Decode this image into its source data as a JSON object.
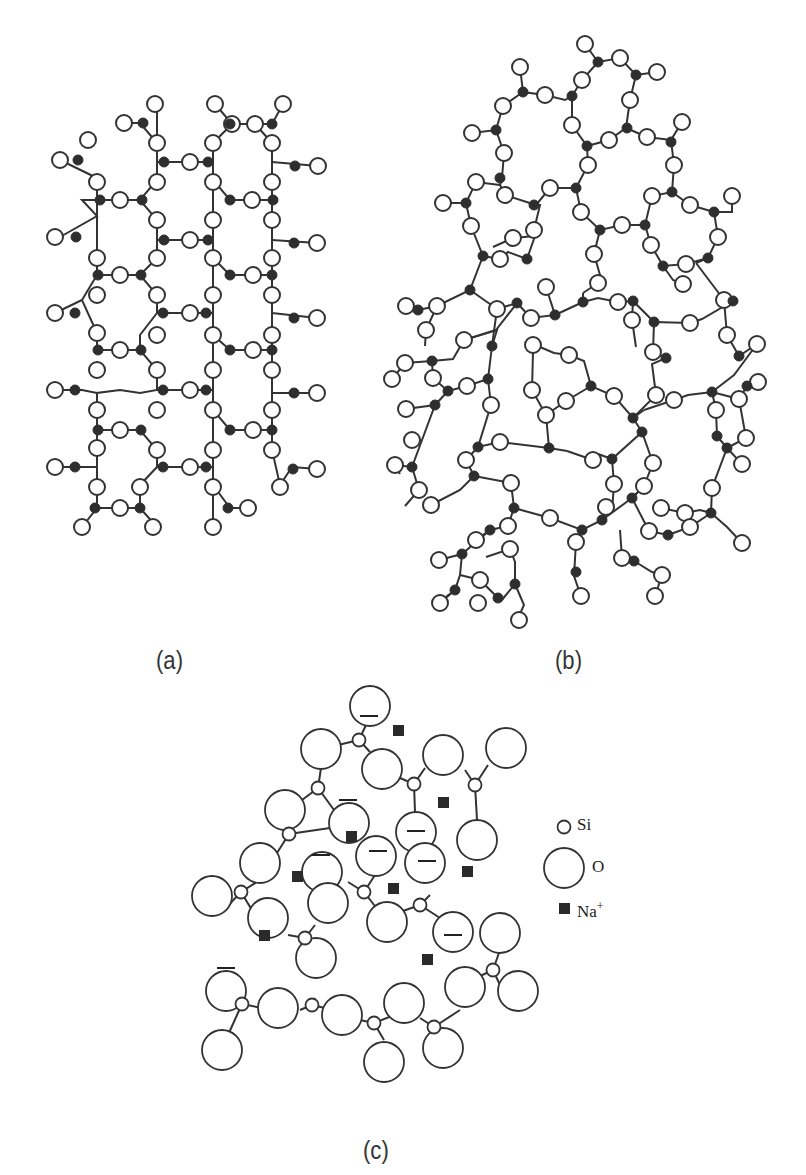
{
  "figure": {
    "panels": [
      {
        "id": "a",
        "label": "(a)",
        "description": "crystalline silica network"
      },
      {
        "id": "b",
        "label": "(b)",
        "description": "amorphous silica glass network"
      },
      {
        "id": "c",
        "label": "(c)",
        "description": "soda-silica glass network with Na+ ions"
      }
    ],
    "legend": {
      "si": "Si",
      "o": "O",
      "na": "Na",
      "na_charge": "+"
    },
    "colors": {
      "line": "#333333",
      "si_fill": "#2e2e2e",
      "o_fill": "#ffffff",
      "na_fill": "#2a2a2a"
    }
  },
  "panel_a": {
    "si": [
      [
        157,
        193
      ],
      [
        97,
        216
      ],
      [
        140,
        200
      ],
      [
        212,
        200
      ],
      [
        272,
        200
      ],
      [
        293,
        223
      ],
      [
        97,
        238
      ],
      [
        140,
        240
      ],
      [
        212,
        240
      ],
      [
        272,
        240
      ],
      [
        293,
        261
      ],
      [
        97,
        275
      ],
      [
        140,
        275
      ],
      [
        212,
        275
      ],
      [
        272,
        275
      ],
      [
        75,
        300
      ],
      [
        158,
        300
      ],
      [
        230,
        300
      ],
      [
        292,
        300
      ],
      [
        97,
        313
      ],
      [
        140,
        313
      ],
      [
        212,
        313
      ],
      [
        272,
        313
      ],
      [
        293,
        337
      ],
      [
        97,
        350
      ],
      [
        140,
        350
      ],
      [
        212,
        350
      ],
      [
        272,
        350
      ],
      [
        75,
        390
      ],
      [
        158,
        390
      ],
      [
        230,
        390
      ],
      [
        292,
        390
      ],
      [
        97,
        393
      ],
      [
        140,
        393
      ],
      [
        212,
        393
      ],
      [
        272,
        393
      ],
      [
        293,
        415
      ],
      [
        97,
        430
      ],
      [
        140,
        430
      ],
      [
        212,
        430
      ],
      [
        272,
        430
      ],
      [
        75,
        467
      ],
      [
        158,
        467
      ],
      [
        230,
        467
      ],
      [
        292,
        467
      ],
      [
        97,
        508
      ],
      [
        140,
        508
      ],
      [
        212,
        508
      ],
      [
        230,
        508
      ]
    ],
    "o": [
      [
        155,
        104
      ],
      [
        124,
        123
      ],
      [
        215,
        104
      ],
      [
        283,
        104
      ],
      [
        232,
        124
      ],
      [
        255,
        124
      ],
      [
        157,
        143
      ],
      [
        213,
        143
      ],
      [
        272,
        143
      ],
      [
        93,
        140
      ],
      [
        60,
        160
      ],
      [
        157,
        162
      ],
      [
        190,
        162
      ],
      [
        235,
        162
      ],
      [
        272,
        162
      ],
      [
        318,
        166
      ],
      [
        97,
        178
      ],
      [
        157,
        180
      ],
      [
        213,
        180
      ],
      [
        272,
        180
      ],
      [
        120,
        200
      ],
      [
        252,
        200
      ],
      [
        82,
        200
      ],
      [
        157,
        220
      ],
      [
        213,
        220
      ],
      [
        272,
        220
      ],
      [
        55,
        237
      ],
      [
        190,
        240
      ],
      [
        317,
        243
      ],
      [
        97,
        260
      ],
      [
        157,
        258
      ],
      [
        213,
        258
      ],
      [
        272,
        258
      ],
      [
        120,
        275
      ],
      [
        253,
        275
      ],
      [
        82,
        278
      ],
      [
        157,
        295
      ],
      [
        213,
        295
      ],
      [
        272,
        295
      ],
      [
        55,
        313
      ],
      [
        190,
        313
      ],
      [
        317,
        318
      ],
      [
        97,
        333
      ],
      [
        157,
        335
      ],
      [
        213,
        335
      ],
      [
        272,
        335
      ],
      [
        120,
        350
      ],
      [
        253,
        350
      ],
      [
        82,
        355
      ],
      [
        157,
        370
      ],
      [
        213,
        370
      ],
      [
        272,
        370
      ],
      [
        55,
        390
      ],
      [
        190,
        390
      ],
      [
        317,
        393
      ],
      [
        97,
        410
      ],
      [
        157,
        410
      ],
      [
        213,
        410
      ],
      [
        272,
        410
      ],
      [
        120,
        430
      ],
      [
        253,
        430
      ],
      [
        82,
        432
      ],
      [
        157,
        450
      ],
      [
        213,
        450
      ],
      [
        272,
        450
      ],
      [
        55,
        467
      ],
      [
        190,
        467
      ],
      [
        317,
        469
      ],
      [
        97,
        485
      ],
      [
        157,
        485
      ],
      [
        213,
        485
      ],
      [
        280,
        485
      ],
      [
        120,
        505
      ],
      [
        248,
        508
      ],
      [
        82,
        527
      ],
      [
        153,
        527
      ],
      [
        213,
        527
      ]
    ]
  },
  "panel_c": {
    "o_big": [
      [
        370,
        706
      ],
      [
        321,
        749
      ],
      [
        380,
        770
      ],
      [
        443,
        755
      ],
      [
        503,
        747
      ],
      [
        288,
        812
      ],
      [
        349,
        823
      ],
      [
        416,
        831
      ],
      [
        477,
        840
      ],
      [
        242,
        880
      ],
      [
        306,
        882
      ],
      [
        375,
        873
      ],
      [
        436,
        878
      ],
      [
        221,
        916
      ],
      [
        330,
        915
      ],
      [
        389,
        922
      ],
      [
        454,
        930
      ],
      [
        271,
        934
      ],
      [
        434,
        966
      ],
      [
        528,
        925
      ],
      [
        226,
        990
      ],
      [
        315,
        979
      ],
      [
        478,
        977
      ],
      [
        292,
        1010
      ],
      [
        360,
        1018
      ],
      [
        420,
        1006
      ],
      [
        541,
        1009
      ],
      [
        217,
        1052
      ],
      [
        385,
        1055
      ],
      [
        488,
        1046
      ],
      [
        440,
        1085
      ],
      [
        384,
        1098
      ]
    ],
    "charged": [
      [
        370,
        706
      ],
      [
        349,
        823
      ],
      [
        416,
        831
      ],
      [
        321,
        882
      ],
      [
        375,
        873
      ],
      [
        436,
        878
      ],
      [
        454,
        930
      ],
      [
        226,
        990
      ]
    ],
    "si_small": [
      [
        359,
        740
      ],
      [
        318,
        788
      ],
      [
        414,
        784
      ],
      [
        475,
        785
      ],
      [
        289,
        834
      ],
      [
        241,
        892
      ],
      [
        364,
        892
      ],
      [
        420,
        905
      ],
      [
        305,
        938
      ],
      [
        493,
        970
      ],
      [
        242,
        1004
      ],
      [
        312,
        1005
      ],
      [
        374,
        1023
      ],
      [
        434,
        1027
      ]
    ],
    "na": [
      [
        398,
        730
      ],
      [
        443,
        802
      ],
      [
        351,
        836
      ],
      [
        297,
        876
      ],
      [
        393,
        888
      ],
      [
        467,
        871
      ],
      [
        264,
        935
      ],
      [
        427,
        959
      ]
    ]
  }
}
